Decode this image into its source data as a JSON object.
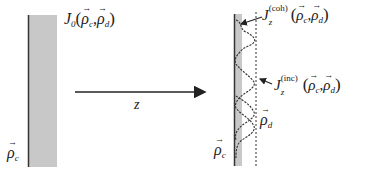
{
  "diagram": {
    "left_plane": {
      "label_symbol": "J",
      "label_subscript": "0",
      "label_args": [
        "ρ",
        "c",
        "ρ",
        "d"
      ],
      "position_label": "ρ",
      "position_subscript": "c"
    },
    "propagation": {
      "axis_label": "z"
    },
    "right_plane": {
      "coherent_label": {
        "symbol": "J",
        "subscript": "z",
        "superscript": "(coh)",
        "args": [
          "ρ",
          "c",
          "ρ",
          "d"
        ]
      },
      "incoherent_label": {
        "symbol": "J",
        "subscript": "z",
        "superscript": "(inc)",
        "args": [
          "ρ",
          "c",
          "ρ",
          "d"
        ]
      },
      "difference_label": "ρ",
      "difference_subscript": "d",
      "position_label": "ρ",
      "position_subscript": "c"
    },
    "colors": {
      "slab_fill": "#c8c8c8",
      "line": "#222222"
    }
  }
}
